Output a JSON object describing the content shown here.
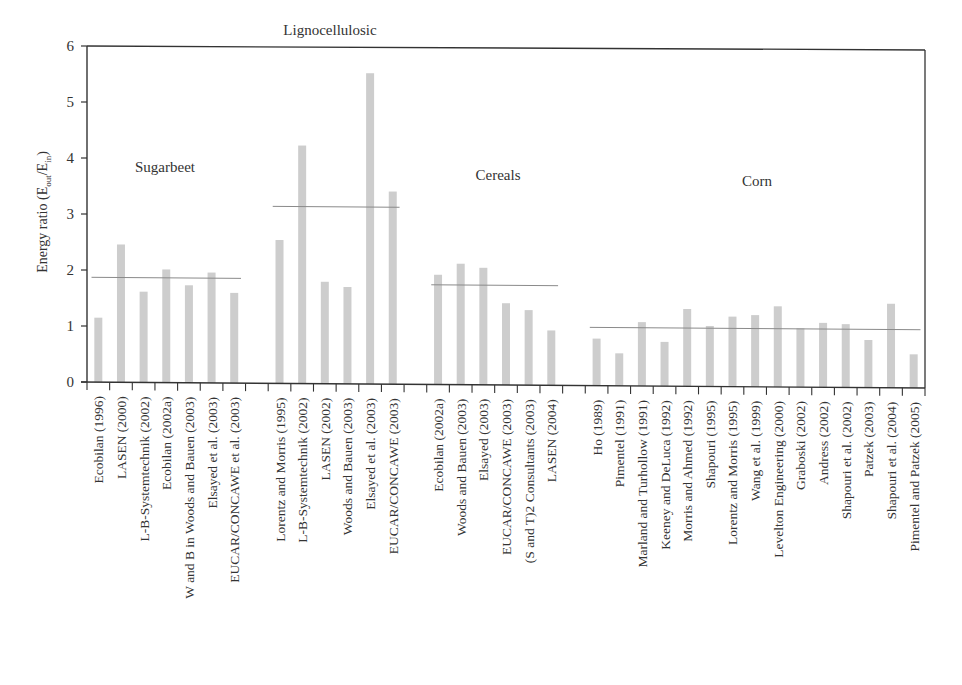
{
  "chart_data": {
    "type": "bar",
    "title": "",
    "xlabel": "",
    "ylabel": "Energy ratio (E_out/E_in)",
    "ylabel_parts": {
      "main": "Energy ratio (E",
      "sub1": "out",
      "mid": "/E",
      "sub2": "in",
      "end": ")"
    },
    "ylim": [
      0,
      6
    ],
    "yticks": [
      0,
      1,
      2,
      3,
      4,
      5,
      6
    ],
    "grid": false,
    "legend": null,
    "bar_color": "#cdcdcd",
    "mean_line_color": "#8a8a8a",
    "groups": [
      {
        "name": "Sugarbeet",
        "mean": 1.87,
        "categories": [
          "Ecobilan (1996)",
          "LASEN (2000)",
          "L-B-Systemtechnik (2002)",
          "Ecobilan (2002a)",
          "W and B in Woods and Bauen (2003)",
          "Elsayed et al. (2003)",
          "EUCAR/CONCAWE et al. (2003)"
        ],
        "values": [
          1.15,
          2.46,
          1.62,
          2.02,
          1.74,
          1.97,
          1.61
        ]
      },
      {
        "name": "Lignocellulosic",
        "mean": 3.16,
        "categories": [
          "Lorentz and Morris (1995)",
          "L-B-Systemtechnik (2002)",
          "LASEN (2002)",
          "Woods and Bauen (2003)",
          "Elsayed et al. (2003)",
          "EUCAR/CONCAWE (2003)"
        ],
        "values": [
          2.56,
          4.25,
          1.82,
          1.73,
          5.55,
          3.44
        ]
      },
      {
        "name": "Cereals",
        "mean": 1.78,
        "categories": [
          "Ecobilan (2002a)",
          "Woods and Bauen (2003)",
          "Elsayed (2003)",
          "EUCAR/CONCAWE (2003)",
          "(S and T)2 Consultants (2003)",
          "LASEN (2004)"
        ],
        "values": [
          1.96,
          2.16,
          2.09,
          1.46,
          1.34,
          0.98
        ]
      },
      {
        "name": "Corn",
        "mean": 1.04,
        "categories": [
          "Ho (1989)",
          "Pimentel (1991)",
          "Marland and Turhollow (1991)",
          "Keeney and DeLuca (1992)",
          "Morris and Ahmed (1992)",
          "Shapouri (1995)",
          "Lorentz and Morris (1995)",
          "Wang et al. (1999)",
          "Levelton Engineering (2000)",
          "Graboski (2002)",
          "Andress (2002)",
          "Shapouri et al. (2002)",
          "Patzek (2003)",
          "Shapouri et al. (2004)",
          "Pimentel and Patzek (2005)"
        ],
        "values": [
          0.84,
          0.58,
          1.14,
          0.79,
          1.38,
          1.08,
          1.25,
          1.28,
          1.44,
          1.05,
          1.15,
          1.13,
          0.85,
          1.5,
          0.6
        ]
      }
    ],
    "group_label_positions": [
      {
        "name": "Sugarbeet",
        "y_value": 3.75
      },
      {
        "name": "Lignocellulosic",
        "y_value": 6.0
      },
      {
        "name": "Cereals",
        "y_value": 3.6
      },
      {
        "name": "Corn",
        "y_value": 3.5
      }
    ]
  }
}
